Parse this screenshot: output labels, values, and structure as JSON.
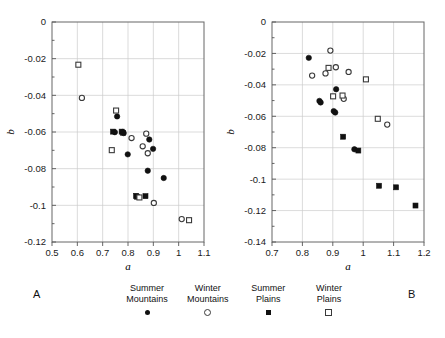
{
  "figure": {
    "panel_labels": {
      "left": "A",
      "right": "B"
    }
  },
  "legend": {
    "entries": [
      {
        "line1": "Summer",
        "line2": "Mountains",
        "marker": "filled-circle"
      },
      {
        "line1": "Winter",
        "line2": "Mountains",
        "marker": "open-circle"
      },
      {
        "line1": "Summer",
        "line2": "Plains",
        "marker": "filled-square"
      },
      {
        "line1": "Winter",
        "line2": "Plains",
        "marker": "open-square"
      }
    ]
  },
  "chart_data": [
    {
      "type": "scatter",
      "panel": "A",
      "title": "",
      "xlabel": "a",
      "ylabel": "b",
      "xlim": [
        0.5,
        1.1
      ],
      "ylim": [
        -0.12,
        0.0
      ],
      "xticks": [
        0.5,
        0.6,
        0.7,
        0.8,
        0.9,
        1.0,
        1.1
      ],
      "xticklabels": [
        "0.5",
        "0.6",
        "0.7",
        "0.8",
        "0.9",
        "1",
        "1.1"
      ],
      "yticks": [
        0.0,
        -0.02,
        -0.04,
        -0.06,
        -0.08,
        -0.1,
        -0.12
      ],
      "yticklabels": [
        "0",
        "-0.02",
        "-0.04",
        "-0.06",
        "-0.08",
        "-0.1",
        "-0.12"
      ],
      "grid": true,
      "legend_position": "below-figure",
      "series": [
        {
          "name": "Summer Mountains",
          "marker": "filled-circle",
          "points": [
            [
              0.757,
              -0.0515
            ],
            [
              0.748,
              -0.0601
            ],
            [
              0.778,
              -0.06
            ],
            [
              0.783,
              -0.0606
            ],
            [
              0.799,
              -0.0722
            ],
            [
              0.884,
              -0.0641
            ],
            [
              0.899,
              -0.0692
            ],
            [
              0.878,
              -0.0811
            ],
            [
              0.941,
              -0.0851
            ]
          ]
        },
        {
          "name": "Winter Mountains",
          "marker": "open-circle",
          "points": [
            [
              0.618,
              -0.0414
            ],
            [
              0.814,
              -0.0633
            ],
            [
              0.872,
              -0.0609
            ],
            [
              0.858,
              -0.0678
            ],
            [
              0.878,
              -0.0716
            ],
            [
              0.902,
              -0.0987
            ],
            [
              1.012,
              -0.1075
            ]
          ]
        },
        {
          "name": "Summer Plains",
          "marker": "filled-square",
          "points": [
            [
              0.741,
              -0.0598
            ],
            [
              0.775,
              -0.0598
            ],
            [
              0.781,
              -0.0604
            ],
            [
              0.832,
              -0.0948
            ],
            [
              0.836,
              -0.0953
            ],
            [
              0.869,
              -0.095
            ]
          ]
        },
        {
          "name": "Winter Plains",
          "marker": "open-square",
          "points": [
            [
              0.604,
              -0.0233
            ],
            [
              0.753,
              -0.0483
            ],
            [
              0.736,
              -0.0699
            ],
            [
              0.845,
              -0.0957
            ],
            [
              1.041,
              -0.1081
            ]
          ]
        }
      ]
    },
    {
      "type": "scatter",
      "panel": "B",
      "title": "",
      "xlabel": "a",
      "ylabel": "b",
      "xlim": [
        0.7,
        1.2
      ],
      "ylim": [
        -0.14,
        0.0
      ],
      "xticks": [
        0.7,
        0.8,
        0.9,
        1.0,
        1.1,
        1.2
      ],
      "xticklabels": [
        "0.7",
        "0.8",
        "0.9",
        "1",
        "1.1",
        "1.2"
      ],
      "yticks": [
        0.0,
        -0.02,
        -0.04,
        -0.06,
        -0.08,
        -0.1,
        -0.12,
        -0.14
      ],
      "yticklabels": [
        "0",
        "-0.02",
        "-0.04",
        "-0.06",
        "-0.08",
        "-0.1",
        "-0.12",
        "-0.14"
      ],
      "grid": true,
      "legend_position": "below-figure",
      "series": [
        {
          "name": "Summer Mountains",
          "marker": "filled-circle",
          "points": [
            [
              0.821,
              -0.0228
            ],
            [
              0.911,
              -0.0428
            ],
            [
              0.856,
              -0.0502
            ],
            [
              0.86,
              -0.0512
            ],
            [
              0.903,
              -0.0567
            ],
            [
              0.908,
              -0.0576
            ],
            [
              0.971,
              -0.081
            ]
          ]
        },
        {
          "name": "Winter Mountains",
          "marker": "open-circle",
          "points": [
            [
              0.892,
              -0.0182
            ],
            [
              0.832,
              -0.0341
            ],
            [
              0.91,
              -0.0288
            ],
            [
              0.876,
              -0.0327
            ],
            [
              0.952,
              -0.0318
            ],
            [
              0.936,
              -0.0489
            ],
            [
              1.079,
              -0.0653
            ]
          ]
        },
        {
          "name": "Summer Plains",
          "marker": "filled-square",
          "points": [
            [
              0.934,
              -0.073
            ],
            [
              0.984,
              -0.0818
            ],
            [
              1.052,
              -0.1042
            ],
            [
              1.108,
              -0.1052
            ],
            [
              1.172,
              -0.1168
            ]
          ]
        },
        {
          "name": "Winter Plains",
          "marker": "open-square",
          "points": [
            [
              0.886,
              -0.0292
            ],
            [
              0.932,
              -0.0468
            ],
            [
              0.901,
              -0.0473
            ],
            [
              1.009,
              -0.0365
            ],
            [
              1.048,
              -0.0616
            ]
          ]
        }
      ]
    }
  ]
}
